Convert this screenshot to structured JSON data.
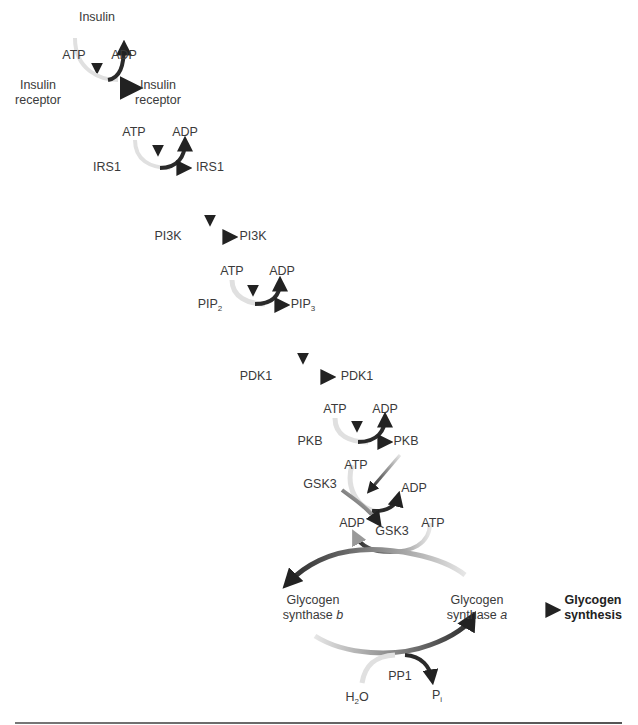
{
  "diagram": {
    "colors": {
      "arrow_dark": "#2a2a2a",
      "arrow_light": "#d8d8d8",
      "text": "#3a3a3a"
    },
    "steps": {
      "insulin": {
        "effector": "Insulin",
        "atp": "ATP",
        "adp": "ADP",
        "from": [
          "Insulin",
          "receptor"
        ],
        "to": [
          "Insulin",
          "receptor"
        ]
      },
      "irs1": {
        "atp": "ATP",
        "adp": "ADP",
        "from": "IRS1",
        "to": "IRS1"
      },
      "pi3k": {
        "from": "PI3K",
        "to": "PI3K"
      },
      "pip": {
        "atp": "ATP",
        "adp": "ADP",
        "from_base": "PIP",
        "from_sub": "2",
        "to_base": "PIP",
        "to_sub": "3"
      },
      "pdk1": {
        "from": "PDK1",
        "to": "PDK1"
      },
      "pkb": {
        "atp": "ATP",
        "adp": "ADP",
        "from": "PKB",
        "to": "PKB"
      },
      "gsk3": {
        "atp": "ATP",
        "adp": "ADP",
        "from": "GSK3",
        "to": "GSK3"
      },
      "glycogen_synthase": {
        "atp": "ATP",
        "adp": "ADP",
        "b_line1": "Glycogen",
        "b_line2_text": "synthase ",
        "b_italic": "b",
        "a_line1": "Glycogen",
        "a_line2_text": "synthase ",
        "a_italic": "a",
        "pp1": "PP1",
        "h2o_base": "H",
        "h2o_sub": "2",
        "h2o_end": "O",
        "pi_base": "P",
        "pi_sub": "i"
      },
      "output": {
        "line1": "Glycogen",
        "line2": "synthesis"
      }
    }
  }
}
